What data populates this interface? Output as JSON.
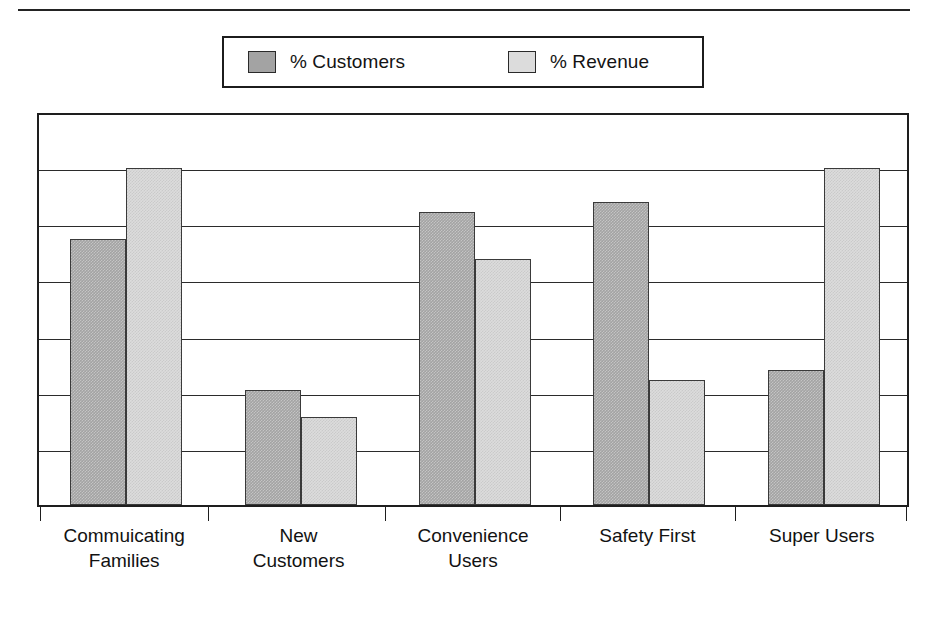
{
  "legend": {
    "position": "top-center",
    "entries": [
      {
        "label": "% Customers",
        "color": "#a3a3a3",
        "icon": "square-swatch-dark"
      },
      {
        "label": "% Revenue",
        "color": "#dcdcdc",
        "icon": "square-swatch-light"
      }
    ]
  },
  "chart_data": {
    "type": "bar",
    "title": "",
    "subtitle": "",
    "xlabel": "",
    "ylabel": "",
    "ylim": [
      0,
      100
    ],
    "grid": true,
    "gridlines": [
      0,
      14.3,
      28.6,
      42.9,
      57.1,
      71.4,
      85.7,
      100
    ],
    "legend_position": "top-center",
    "categories": [
      "Commuicating Families",
      "New Customers",
      "Convenience Users",
      "Safety First",
      "Super Users"
    ],
    "category_lines": [
      [
        "Commuicating",
        "Families"
      ],
      [
        "New",
        "Customers"
      ],
      [
        "Convenience",
        "Users"
      ],
      [
        "Safety First"
      ],
      [
        "Super Users"
      ]
    ],
    "series": [
      {
        "name": "% Customers",
        "color": "#a3a3a3",
        "values": [
          79,
          34,
          87,
          90,
          40
        ]
      },
      {
        "name": "% Revenue",
        "color": "#dcdcdc",
        "values": [
          100,
          26,
          73,
          37,
          100
        ]
      }
    ]
  },
  "axis": {
    "tick_count": 6,
    "tick_positions_pct": [
      0.3,
      19.6,
      39.9,
      60.0,
      80.1,
      99.7
    ]
  },
  "colors": {
    "frame": "#1e1e1e",
    "gridline": "#2b2b2b",
    "bar_outline": "#3a3a3a",
    "text": "#121212",
    "background": "#ffffff"
  }
}
